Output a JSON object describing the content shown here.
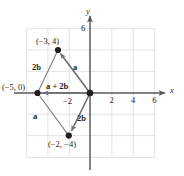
{
  "figure": {
    "type": "vector-diagram"
  },
  "axes": {
    "x_label": "x",
    "y_label": "y",
    "x_ticks": [
      {
        "label": "2",
        "value": 2
      },
      {
        "label": "4",
        "value": 4
      },
      {
        "label": "6",
        "value": 6
      },
      {
        "label": "−2",
        "value": -2
      }
    ],
    "y_ticks": [
      {
        "label": "6",
        "value": 6
      }
    ],
    "xlim": [
      -6,
      7
    ],
    "ylim": [
      -6,
      6
    ],
    "grid": true,
    "grid_step": 2,
    "grid_color": "#d9d9da",
    "axis_color": "#6d6e70"
  },
  "points": [
    {
      "name": "point-neg3-4",
      "label": "(−3, 4)",
      "x": -3,
      "y": 4
    },
    {
      "name": "point-neg5-0",
      "label": "(−5, 0)",
      "x": -5,
      "y": 0
    },
    {
      "name": "point-neg2-neg4",
      "label": "(−2, −4)",
      "x": -2,
      "y": -4
    },
    {
      "name": "point-origin",
      "label": "",
      "x": 0,
      "y": 0
    }
  ],
  "vectors": [
    {
      "name": "vector-a-upper",
      "label": "a",
      "from": [
        0,
        0
      ],
      "to": [
        -3,
        4
      ],
      "style": "arrow"
    },
    {
      "name": "vector-2b-upper",
      "label": "2b",
      "from": [
        -3,
        4
      ],
      "to": [
        -5,
        0
      ],
      "style": "plain"
    },
    {
      "name": "vector-a-plus-2b",
      "label": "a + 2b",
      "from": [
        0,
        0
      ],
      "to": [
        -5,
        0
      ],
      "style": "arrow"
    },
    {
      "name": "vector-2b-lower",
      "label": "2b",
      "from": [
        0,
        0
      ],
      "to": [
        -2,
        -4
      ],
      "style": "arrow"
    },
    {
      "name": "vector-a-lower",
      "label": "a",
      "from": [
        -5,
        0
      ],
      "to": [
        -2,
        -4
      ],
      "style": "plain"
    }
  ],
  "colors": {
    "ink": "#231f20",
    "vector": "#6d6e70",
    "grid": "#d9d9da",
    "axis": "#58595b"
  }
}
